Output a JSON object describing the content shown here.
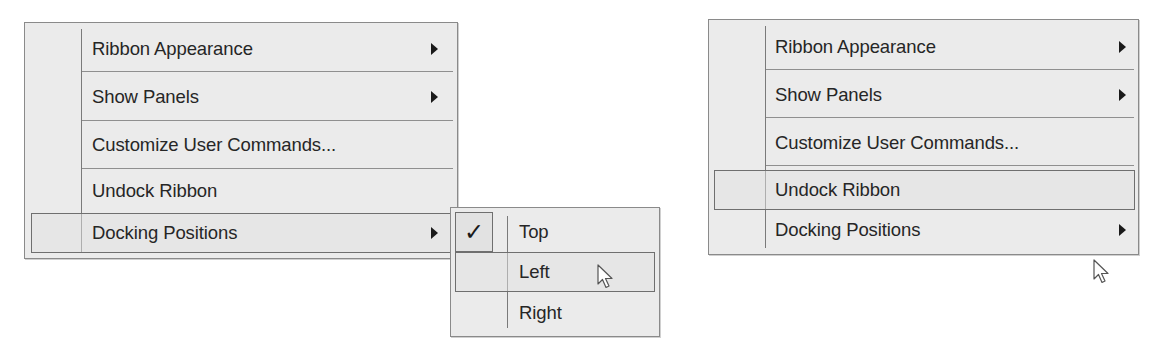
{
  "menu_left": {
    "items": [
      {
        "label": "Ribbon Appearance",
        "has_submenu": true,
        "highlighted": false
      },
      {
        "label": "Show Panels",
        "has_submenu": true,
        "highlighted": false
      },
      {
        "label": "Customize User Commands...",
        "has_submenu": false,
        "highlighted": false
      },
      {
        "label": "Undock Ribbon",
        "has_submenu": false,
        "highlighted": false
      },
      {
        "label": "Docking Positions",
        "has_submenu": true,
        "highlighted": true
      }
    ]
  },
  "submenu_docking": {
    "items": [
      {
        "label": "Top",
        "checked": true,
        "highlighted": false
      },
      {
        "label": "Left",
        "checked": false,
        "highlighted": true
      },
      {
        "label": "Right",
        "checked": false,
        "highlighted": false
      }
    ]
  },
  "menu_right": {
    "items": [
      {
        "label": "Ribbon Appearance",
        "has_submenu": true,
        "highlighted": false
      },
      {
        "label": "Show Panels",
        "has_submenu": true,
        "highlighted": false
      },
      {
        "label": "Customize User Commands...",
        "has_submenu": false,
        "highlighted": false
      },
      {
        "label": "Undock Ribbon",
        "has_submenu": false,
        "highlighted": true
      },
      {
        "label": "Docking Positions",
        "has_submenu": true,
        "highlighted": false
      }
    ]
  },
  "icons": {
    "submenu_arrow": "triangle-right",
    "check": "✓",
    "cursor": "arrow-pointer"
  },
  "colors": {
    "menu_bg": "#ebebeb",
    "border": "#8a8a8a",
    "text": "#262626",
    "highlight_border": "#6f6f6f"
  }
}
